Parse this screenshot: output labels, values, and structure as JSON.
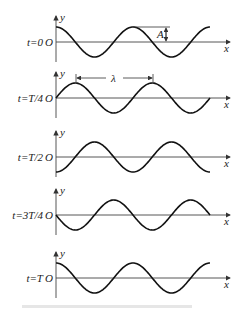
{
  "diagram": {
    "axis_labels": {
      "x": "x",
      "y": "y",
      "origin": "O"
    },
    "annotations": {
      "amplitude": "A",
      "wavelength": "λ"
    },
    "panels": [
      {
        "time_label": "t=0",
        "phase": 0
      },
      {
        "time_label": "t=T/4",
        "phase": 0.25
      },
      {
        "time_label": "t=T/2",
        "phase": 0.5
      },
      {
        "time_label": "t=3T/4",
        "phase": 0.75
      },
      {
        "time_label": "t=T",
        "phase": 1.0
      }
    ]
  },
  "colors": {
    "line": "#111111",
    "axis": "#444444",
    "background": "#ffffff"
  }
}
